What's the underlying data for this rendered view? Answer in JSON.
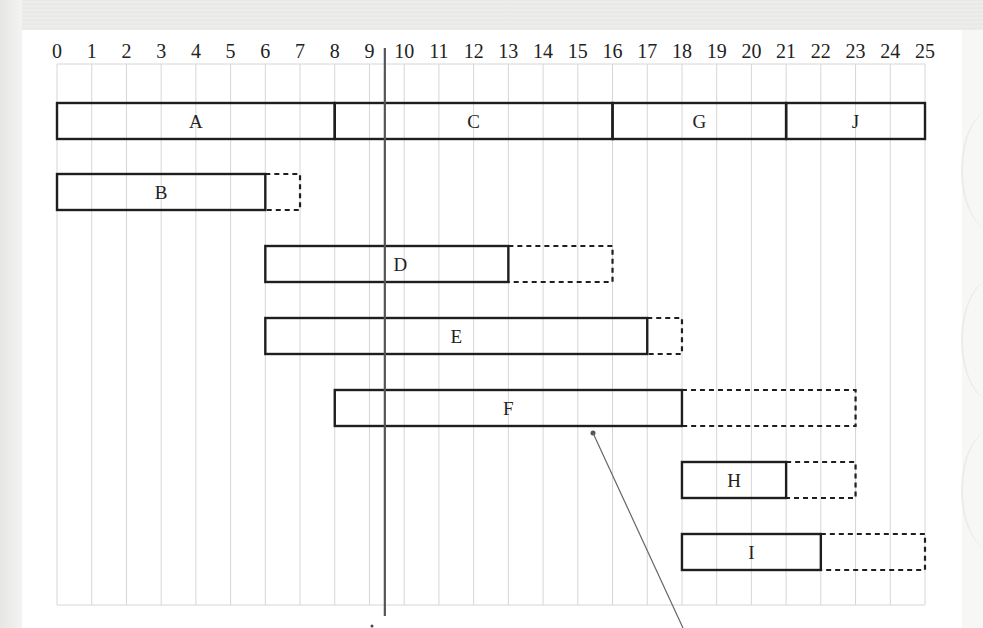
{
  "chart_data": {
    "type": "gantt",
    "title": "",
    "xlabel": "",
    "ylabel": "",
    "x_ticks": [
      0,
      1,
      2,
      3,
      4,
      5,
      6,
      7,
      8,
      9,
      10,
      11,
      12,
      13,
      14,
      15,
      16,
      17,
      18,
      19,
      20,
      21,
      22,
      23,
      24,
      25
    ],
    "xlim": [
      0,
      25
    ],
    "grid": true,
    "today_marker": 9.5,
    "rows": [
      {
        "row": 1,
        "tasks": [
          {
            "name": "A",
            "start": 0,
            "end": 8,
            "float_end": 8
          },
          {
            "name": "C",
            "start": 8,
            "end": 16,
            "float_end": 16
          },
          {
            "name": "G",
            "start": 16,
            "end": 21,
            "float_end": 21
          },
          {
            "name": "J",
            "start": 21,
            "end": 25,
            "float_end": 25
          }
        ]
      },
      {
        "row": 2,
        "tasks": [
          {
            "name": "B",
            "start": 0,
            "end": 6,
            "float_end": 7
          }
        ]
      },
      {
        "row": 3,
        "tasks": [
          {
            "name": "D",
            "start": 6,
            "end": 13,
            "float_end": 16
          }
        ]
      },
      {
        "row": 4,
        "tasks": [
          {
            "name": "E",
            "start": 6,
            "end": 17,
            "float_end": 18
          }
        ]
      },
      {
        "row": 5,
        "tasks": [
          {
            "name": "F",
            "start": 8,
            "end": 18,
            "float_end": 23
          }
        ]
      },
      {
        "row": 6,
        "tasks": [
          {
            "name": "H",
            "start": 18,
            "end": 21,
            "float_end": 23
          }
        ]
      },
      {
        "row": 7,
        "tasks": [
          {
            "name": "I",
            "start": 18,
            "end": 22,
            "float_end": 25
          }
        ]
      }
    ],
    "legend": {
      "solid_box": "activity duration",
      "dashed_box": "float"
    },
    "annotations": [
      {
        "type": "leader-line",
        "from_x": 15.5,
        "from_row": 5,
        "direction": "down-right, off page"
      }
    ]
  },
  "colors": {
    "bar_stroke": "#1e1e1e",
    "grid": "#d6d6d6",
    "today_line": "#555555",
    "background": "#ffffff"
  }
}
